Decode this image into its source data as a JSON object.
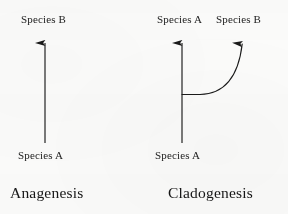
{
  "figure": {
    "type": "evolutionary-mode-diagram",
    "background_color": "#fbfbfa",
    "ink_color": "#1a1a1a",
    "panels": [
      {
        "name": "anagenesis",
        "caption": "Anagenesis",
        "ancestor_label": "Species A",
        "descendant_labels": [
          "Species B"
        ],
        "description": "single straight vertical arrow from Species A up to Species B"
      },
      {
        "name": "cladogenesis",
        "caption": "Cladogenesis",
        "ancestor_label": "Species A",
        "descendant_labels": [
          "Species A",
          "Species B"
        ],
        "description": "vertical arrow continuing to Species A with a curved branch splitting right and up to Species B"
      }
    ]
  },
  "left_panel": {
    "top_label": "Species B",
    "bottom_label": "Species A",
    "caption": "Anagenesis"
  },
  "right_panel": {
    "top_label_a": "Species A",
    "top_label_b": "Species B",
    "bottom_label": "Species A",
    "caption": "Cladogenesis"
  },
  "geometry": {
    "left_stem_x": 45,
    "left_stem_top_y": 32,
    "left_stem_bottom_y": 143,
    "right_stem_x": 182,
    "right_stem_top_y": 32,
    "right_stem_bottom_y": 143,
    "branch_y": 94,
    "right_branch_tip_x": 243,
    "right_branch_tip_y": 32
  }
}
